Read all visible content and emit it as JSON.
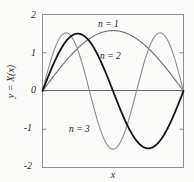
{
  "chart_data": {
    "type": "line",
    "title": "",
    "xlabel": "x",
    "ylabel": "y = X(x)",
    "xlim": [
      0,
      1
    ],
    "ylim": [
      -2,
      2
    ],
    "grid": false,
    "legend_position": "inline-annotations",
    "yticks": [
      "2",
      "1",
      "0",
      "-1",
      "-2"
    ],
    "ytick_values": [
      2,
      1,
      0,
      -1,
      -2
    ],
    "xticks": [],
    "series": [
      {
        "name": "n = 1",
        "color": "#6e6e6e",
        "linewidth": 1.1,
        "label_x": 0.42,
        "label_y": 1.82,
        "amplitude": 1.58,
        "halfwaves": 1,
        "x": [
          0,
          0.05,
          0.1,
          0.15,
          0.2,
          0.25,
          0.3,
          0.35,
          0.4,
          0.45,
          0.5,
          0.55,
          0.6,
          0.65,
          0.7,
          0.75,
          0.8,
          0.85,
          0.9,
          0.95,
          1
        ],
        "y": [
          0,
          0.247,
          0.488,
          0.717,
          0.929,
          1.117,
          1.278,
          1.406,
          1.5,
          1.557,
          1.575,
          1.557,
          1.5,
          1.406,
          1.278,
          1.117,
          0.929,
          0.717,
          0.488,
          0.247,
          0
        ]
      },
      {
        "name": "n = 2",
        "color": "#141414",
        "linewidth": 1.8,
        "label_x": 0.44,
        "label_y": 1.0,
        "amplitude": 1.5,
        "halfwaves": 2,
        "x": [
          0,
          0.05,
          0.1,
          0.15,
          0.2,
          0.25,
          0.3,
          0.35,
          0.4,
          0.45,
          0.5,
          0.55,
          0.6,
          0.65,
          0.7,
          0.75,
          0.8,
          0.85,
          0.9,
          0.95,
          1
        ],
        "y": [
          0,
          0.464,
          0.882,
          1.213,
          1.427,
          1.5,
          1.427,
          1.213,
          0.882,
          0.464,
          0,
          -0.464,
          -0.882,
          -1.213,
          -1.427,
          -1.5,
          -1.427,
          -1.213,
          -0.882,
          -0.464,
          0
        ]
      },
      {
        "name": "n = 3",
        "color": "#8c8c8c",
        "linewidth": 1.1,
        "label_x": 0.29,
        "label_y": -0.94,
        "amplitude": 1.52,
        "halfwaves": 3,
        "x": [
          0,
          0.05,
          0.1,
          0.15,
          0.2,
          0.25,
          0.3,
          0.35,
          0.4,
          0.45,
          0.5,
          0.55,
          0.6,
          0.65,
          0.7,
          0.75,
          0.8,
          0.85,
          0.9,
          0.95,
          1
        ],
        "y": [
          0,
          0.657,
          1.193,
          1.497,
          1.52,
          1.075,
          0.47,
          -0.235,
          -0.893,
          -1.33,
          -1.52,
          -1.33,
          -0.893,
          -0.235,
          0.47,
          1.075,
          1.445,
          1.52,
          1.193,
          0.657,
          0
        ]
      }
    ],
    "axis_color": "#8f8f8f",
    "zero_line_color": "#6a6a6a",
    "background": "#fbfbfa"
  }
}
